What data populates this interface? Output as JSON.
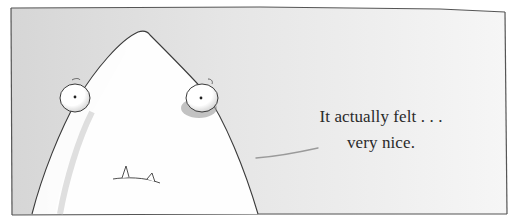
{
  "illustration": {
    "description": "Cartoon panel: a large white pointy-headed creature with two round eyes and two small teeth, speaking a line of dialogue",
    "caption": {
      "lines": [
        "It actually felt . . .",
        "very nice."
      ]
    },
    "colors": {
      "background_left": "#d9d9d9",
      "background_right": "#f4f4f4",
      "creature_fill": "#ffffff",
      "creature_shadow": "#a9a9a9",
      "outline": "#3a3a3a",
      "text": "#2a2a2a",
      "speech_line": "#9a9a9a"
    }
  }
}
